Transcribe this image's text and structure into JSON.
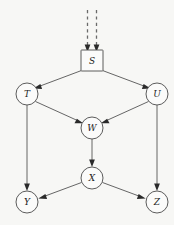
{
  "diagram": {
    "type": "directed-acyclic-graph",
    "background_color": "#f7f7f5",
    "node_stroke_color": "#4a4a4a",
    "edge_color": "#555555",
    "arrow_color": "#2a2a2a",
    "nodes": [
      {
        "id": "S",
        "label": "S",
        "shape": "square",
        "cx": 92,
        "cy": 61,
        "r": 11,
        "half": 11
      },
      {
        "id": "T",
        "label": "T",
        "shape": "circle",
        "cx": 27,
        "cy": 94,
        "r": 11
      },
      {
        "id": "U",
        "label": "U",
        "shape": "circle",
        "cx": 157,
        "cy": 94,
        "r": 11
      },
      {
        "id": "W",
        "label": "W",
        "shape": "circle",
        "cx": 92,
        "cy": 128,
        "r": 11
      },
      {
        "id": "X",
        "label": "X",
        "shape": "circle",
        "cx": 92,
        "cy": 178,
        "r": 11
      },
      {
        "id": "Y",
        "label": "Y",
        "shape": "circle",
        "cx": 27,
        "cy": 202,
        "r": 11
      },
      {
        "id": "Z",
        "label": "Z",
        "shape": "circle",
        "cx": 157,
        "cy": 202,
        "r": 11
      }
    ],
    "edges": [
      {
        "from": "S",
        "to": "T",
        "style": "solid",
        "arrow": true
      },
      {
        "from": "S",
        "to": "U",
        "style": "solid",
        "arrow": true
      },
      {
        "from": "T",
        "to": "W",
        "style": "solid",
        "arrow": true
      },
      {
        "from": "U",
        "to": "W",
        "style": "solid",
        "arrow": true
      },
      {
        "from": "T",
        "to": "Y",
        "style": "solid",
        "arrow": true
      },
      {
        "from": "U",
        "to": "Z",
        "style": "solid",
        "arrow": true
      },
      {
        "from": "W",
        "to": "X",
        "style": "solid",
        "arrow": true
      },
      {
        "from": "X",
        "to": "Y",
        "style": "solid",
        "arrow": true
      },
      {
        "from": "X",
        "to": "Z",
        "style": "solid",
        "arrow": true
      }
    ],
    "incoming_dashed_edges": [
      {
        "id": "dashed-left",
        "x": 87.5,
        "y_start": 10,
        "y_end": 50,
        "target": "S"
      },
      {
        "id": "dashed-right",
        "x": 96.5,
        "y_start": 10,
        "y_end": 50,
        "target": "S"
      }
    ]
  }
}
